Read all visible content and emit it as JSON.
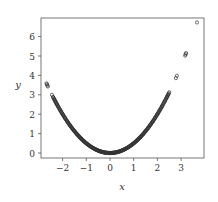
{
  "chart_data": {
    "type": "scatter",
    "title": "",
    "xlabel": "x",
    "ylabel": "y",
    "xlim": [
      -2.9,
      3.9
    ],
    "ylim": [
      -0.25,
      6.95
    ],
    "xticks": [
      -2,
      -1,
      0,
      1,
      2,
      3
    ],
    "yticks": [
      0,
      1,
      2,
      3,
      4,
      5,
      6
    ],
    "xtick_labels": [
      "−2",
      "−1",
      "0",
      "1",
      "2",
      "3"
    ],
    "ytick_labels": [
      "0",
      "1",
      "2",
      "3",
      "4",
      "5",
      "6"
    ],
    "grid": false,
    "legend": null,
    "relation": "y = x^2 / 2",
    "marker": "open-circle",
    "marker_color": "#333333",
    "series": [
      {
        "name": "samples",
        "x": [
          -2.68,
          -2.66,
          -2.64,
          -2.62,
          -2.45,
          -2.4,
          -2.35,
          -2.3,
          -2.25,
          -2.2,
          -2.1,
          -2.0,
          -1.9,
          -1.8,
          -1.7,
          -1.6,
          -1.5,
          -1.4,
          -1.3,
          -1.2,
          -1.1,
          -1.0,
          -0.9,
          -0.8,
          -0.7,
          -0.6,
          -0.5,
          -0.4,
          -0.3,
          -0.2,
          -0.1,
          0.0,
          0.1,
          0.2,
          0.3,
          0.4,
          0.5,
          0.6,
          0.7,
          0.8,
          0.9,
          1.0,
          1.1,
          1.2,
          1.3,
          1.4,
          1.5,
          1.6,
          1.7,
          1.8,
          1.9,
          2.0,
          2.1,
          2.2,
          2.3,
          2.4,
          2.45,
          2.5,
          2.78,
          2.82,
          3.17,
          3.19,
          3.21,
          3.67
        ],
        "y": [
          3.59,
          3.54,
          3.48,
          3.43,
          3.0,
          2.88,
          2.76,
          2.65,
          2.53,
          2.42,
          2.21,
          2.0,
          1.81,
          1.62,
          1.45,
          1.28,
          1.13,
          0.98,
          0.85,
          0.72,
          0.61,
          0.5,
          0.41,
          0.32,
          0.25,
          0.18,
          0.13,
          0.08,
          0.05,
          0.02,
          0.01,
          0.0,
          0.01,
          0.02,
          0.05,
          0.08,
          0.13,
          0.18,
          0.25,
          0.32,
          0.41,
          0.5,
          0.61,
          0.72,
          0.85,
          0.98,
          1.13,
          1.28,
          1.45,
          1.62,
          1.81,
          2.0,
          2.21,
          2.42,
          2.65,
          2.88,
          3.0,
          3.13,
          3.86,
          3.98,
          5.02,
          5.09,
          5.15,
          6.73
        ]
      }
    ]
  }
}
